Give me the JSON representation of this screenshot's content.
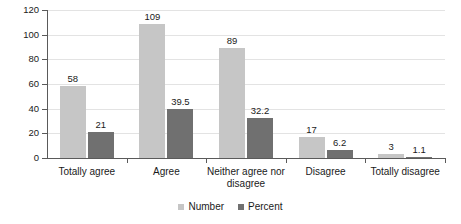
{
  "chart_data": {
    "type": "bar",
    "title": "",
    "subtitle": "",
    "xlabel": "",
    "ylabel": "",
    "ylim": [
      0,
      120
    ],
    "yticks": [
      0,
      20,
      40,
      60,
      80,
      100,
      120
    ],
    "grid": true,
    "legend_position": "bottom-center",
    "categories": [
      "Totally agree",
      "Agree",
      "Neither agree nor disagree",
      "Disagree",
      "Totally disagree"
    ],
    "category_lines": [
      [
        "Totally agree"
      ],
      [
        "Agree"
      ],
      [
        "Neither agree nor",
        "disagree"
      ],
      [
        "Disagree"
      ],
      [
        "Totally disagree"
      ]
    ],
    "series": [
      {
        "name": "Number",
        "color": "#c6c6c6",
        "values": [
          58,
          109,
          89,
          17,
          3
        ],
        "labels": [
          "58",
          "109",
          "89",
          "17",
          "3"
        ]
      },
      {
        "name": "Percent",
        "color": "#707070",
        "values": [
          21,
          39.5,
          32.2,
          6.2,
          1.1
        ],
        "labels": [
          "21",
          "39.5",
          "32.2",
          "6.2",
          "1.1"
        ]
      }
    ]
  },
  "axis": {
    "tick_labels": [
      "0",
      "20",
      "40",
      "60",
      "80",
      "100",
      "120"
    ]
  },
  "legend": {
    "items": [
      {
        "label": "Number",
        "color": "#c6c6c6"
      },
      {
        "label": "Percent",
        "color": "#707070"
      }
    ]
  },
  "colors": {
    "series_number": "#c6c6c6",
    "series_percent": "#707070",
    "gridline": "#e3e3e3",
    "axis": "#5a5a5a",
    "text": "#1a1a1a",
    "background": "#ffffff"
  }
}
